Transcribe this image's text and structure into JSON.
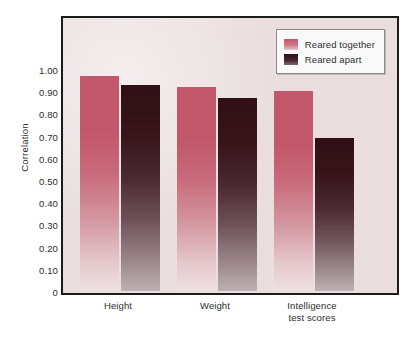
{
  "chart_data": {
    "type": "bar",
    "title": "",
    "xlabel": "",
    "ylabel": "Correlation",
    "ylim": [
      0,
      1.05
    ],
    "grid": false,
    "legend_position": "top-right",
    "categories": [
      "Height",
      "Weight",
      "Intelligence test scores"
    ],
    "category_lines": [
      [
        "Height"
      ],
      [
        "Weight"
      ],
      [
        "Intelligence",
        "test scores"
      ]
    ],
    "series": [
      {
        "name": "Reared together",
        "color": "#c4566a",
        "values": [
          0.97,
          0.92,
          0.9
        ]
      },
      {
        "name": "Reared apart",
        "color": "#2e0d13",
        "values": [
          0.93,
          0.87,
          0.69
        ]
      }
    ],
    "ytick_labels": [
      "1.00",
      "0.90",
      "0.80",
      "0.70",
      "0.60",
      "0.50",
      "0.40",
      "0.30",
      "0.20",
      "0.10",
      "0"
    ],
    "ytick_values": [
      1.0,
      0.9,
      0.8,
      0.7,
      0.6,
      0.5,
      0.4,
      0.3,
      0.2,
      0.1,
      0
    ]
  },
  "legend": {
    "items": [
      {
        "label": "Reared together"
      },
      {
        "label": "Reared apart"
      }
    ]
  },
  "axes": {
    "y_title": "Correlation"
  },
  "colors": {
    "plot_background": "#ece0e0",
    "frame": "#1b1b1b",
    "series_together": "#c4566a",
    "series_apart": "#2e0d13",
    "text": "#2c2c2c"
  }
}
